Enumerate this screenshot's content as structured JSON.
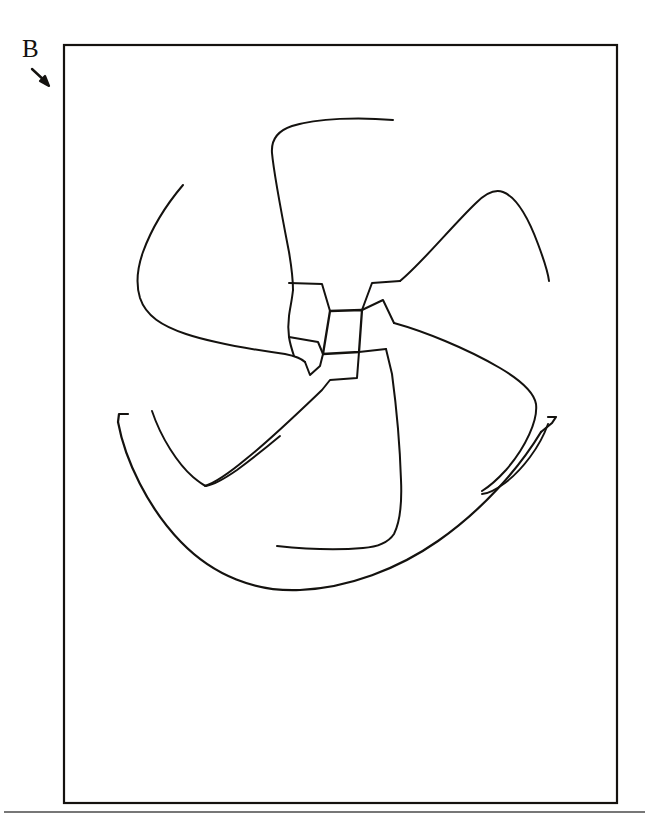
{
  "figure": {
    "panel_label": "B",
    "caption": "",
    "background_color": "#ffffff",
    "ink_color": "#14120f",
    "rule_color": "#4a4a4a",
    "annotations": {
      "pointer_icon": "arrow-down-right-icon",
      "pointer_target": "figure-border-top-left-corner"
    },
    "border": {
      "left": 64,
      "top": 45,
      "right": 617,
      "bottom": 803
    },
    "baseline_rule": {
      "y": 812,
      "x_start": 4,
      "x_end": 645
    },
    "drawing": {
      "hub": {
        "name": "center-hub",
        "points": [
          [
            330,
            311
          ],
          [
            362,
            310
          ],
          [
            359,
            352
          ],
          [
            323,
            354
          ]
        ]
      },
      "strokes": [
        {
          "name": "blade-top-outer-edge",
          "d": "M 393 120 C 360 117 318 118 292 126 C 277 131 271 140 272 153 C 274 175 282 216 289 252 C 292 270 293 282 293 290"
        },
        {
          "name": "blade-top-inner-edge",
          "d": "M 293 290 C 292 300 290 308 289 316 C 288 324 288 330 289 337 C 290 344 292 350 294 356"
        },
        {
          "name": "blade-top-to-hub",
          "d": "M 289 283 L 322 284 L 330 311"
        },
        {
          "name": "blade-left-outer-edge",
          "d": "M 183 185 C 166 205 151 230 143 252 C 137 269 136 285 140 298 C 146 316 162 326 186 334 C 216 344 256 350 285 354 C 295 356 301 358 305 362"
        },
        {
          "name": "blade-left-tip-hook",
          "d": "M 305 362 L 310 375 L 320 366 L 323 354"
        },
        {
          "name": "blade-left-to-hub-upper",
          "d": "M 289 337 L 318 342 L 323 354"
        },
        {
          "name": "blade-right-outer-edge",
          "d": "M 400 281 C 421 264 452 226 476 203 C 486 193 495 189 503 192 C 516 197 528 217 538 244 C 544 260 548 272 549 281"
        },
        {
          "name": "blade-right-shoulder",
          "d": "M 400 281 L 372 283 L 362 310"
        },
        {
          "name": "blade-right-inner-edge",
          "d": "M 362 310 L 383 300 L 394 323"
        },
        {
          "name": "blade-right-lower-edge",
          "d": "M 394 323 C 423 331 466 348 500 368 C 522 381 534 392 536 404 C 538 420 526 447 506 470 C 495 482 487 488 482 491"
        },
        {
          "name": "blade-bottom-right-edge",
          "d": "M 386 349 L 392 374 C 396 404 400 448 401 480 C 402 503 400 522 394 534 C 388 543 377 547 363 548 C 340 550 305 549 277 546"
        },
        {
          "name": "blade-bottom-left-edge",
          "d": "M 359 352 L 357 378 L 330 380 L 322 390 C 300 411 270 440 246 459 C 228 474 214 483 205 486"
        },
        {
          "name": "blade-bottom-hub-link",
          "d": "M 359 352 L 386 349"
        },
        {
          "name": "inner-arc-left",
          "d": "M 152 411 C 161 438 178 464 193 477 C 199 482 203 485 206 486 C 213 485 224 479 237 470 C 252 459 268 446 280 436"
        },
        {
          "name": "outer-arc-bowl",
          "d": "M 118 422 C 125 460 148 508 181 542 C 214 576 256 592 300 590 C 348 588 398 569 438 541 C 481 511 518 470 541 432"
        },
        {
          "name": "outer-arc-left-hook",
          "d": "M 118 422 L 119 414 L 128 414"
        },
        {
          "name": "outer-arc-right-hook",
          "d": "M 541 432 L 552 423 L 556 417 L 548 417"
        },
        {
          "name": "inner-arc-right",
          "d": "M 548 424 C 540 447 522 470 505 483 C 494 491 487 494 482 494"
        }
      ]
    }
  }
}
